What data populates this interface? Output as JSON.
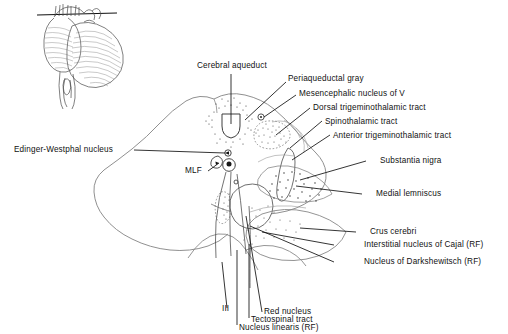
{
  "figure": {
    "background_color": "#ffffff",
    "ink_color": "#111111",
    "outline_color": "#555555",
    "inset": {
      "name": "brainstem-cerebellum-lateral-view",
      "description": "Lateral view of brainstem and cerebellum with horizontal section level line"
    }
  },
  "labels": {
    "cerebral_aqueduct": "Cerebral aqueduct",
    "periaqueductal_gray": "Periaqueductal gray",
    "mesencephalic_nucleus_v": "Mesencephalic nucleus of V",
    "dorsal_trigeminothalamic_tract": "Dorsal trigeminothalamic tract",
    "spinothalamic_tract": "Spinothalamic tract",
    "anterior_trigeminothalamic_tract": "Anterior trigeminothalamic tract",
    "substantia_nigra": "Substantia nigra",
    "medial_lemniscus": "Medial lemniscus",
    "crus_cerebri": "Crus cerebri",
    "interstitial_nucleus_cajal": "Interstitial nucleus of Cajal (RF)",
    "nucleus_darkshewitsch": "Nucleus of Darkshewitsch (RF)",
    "edinger_westphal_nucleus": "Edinger-Westphal nucleus",
    "mlf": "MLF",
    "oculomotor_nerve": "III",
    "red_nucleus": "Red nucleus",
    "tectospinal_tract": "Tectospinal tract",
    "nucleus_linearis": "Nucleus linearis (RF)"
  }
}
